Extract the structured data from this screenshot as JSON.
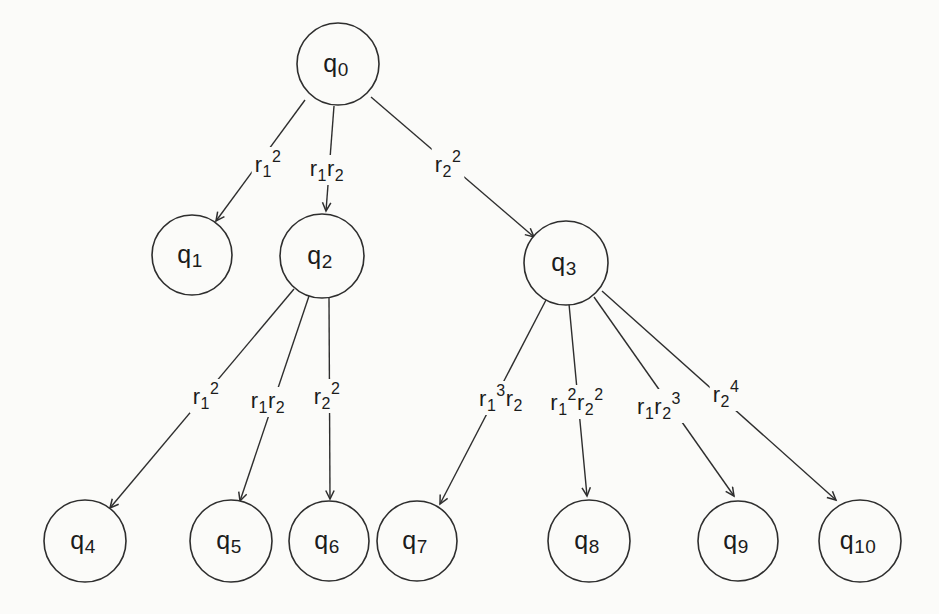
{
  "page": {
    "background": "#fbfbf9",
    "ink": "#2e2e2e",
    "text_color": "#1c1c1c"
  },
  "diagram": {
    "kind": "tree",
    "width": 939,
    "height": 614,
    "nodes": [
      {
        "id": "q0",
        "label": "q_0",
        "x": 338,
        "y": 64,
        "r": 41
      },
      {
        "id": "q1",
        "label": "q_1",
        "x": 192,
        "y": 255,
        "r": 40
      },
      {
        "id": "q2",
        "label": "q_2",
        "x": 322,
        "y": 256,
        "r": 42
      },
      {
        "id": "q3",
        "label": "q_3",
        "x": 566,
        "y": 263,
        "r": 42
      },
      {
        "id": "q4",
        "label": "q_4",
        "x": 85,
        "y": 541,
        "r": 41
      },
      {
        "id": "q5",
        "label": "q_5",
        "x": 231,
        "y": 541,
        "r": 41
      },
      {
        "id": "q6",
        "label": "q_6",
        "x": 329,
        "y": 541,
        "r": 40
      },
      {
        "id": "q7",
        "label": "q_7",
        "x": 417,
        "y": 541,
        "r": 40
      },
      {
        "id": "q8",
        "label": "q_8",
        "x": 589,
        "y": 541,
        "r": 41
      },
      {
        "id": "q9",
        "label": "q_9",
        "x": 738,
        "y": 541,
        "r": 40
      },
      {
        "id": "q10",
        "label": "q_10",
        "x": 860,
        "y": 541,
        "r": 41
      }
    ],
    "edges": [
      {
        "from": "q0",
        "to": "q1",
        "label": "r_1^2",
        "x1": 305,
        "y1": 100,
        "x2": 216,
        "y2": 221,
        "lx": 268,
        "ly": 172
      },
      {
        "from": "q0",
        "to": "q2",
        "label": "r_1r_2",
        "x1": 334,
        "y1": 106,
        "x2": 326,
        "y2": 211,
        "lx": 327,
        "ly": 176
      },
      {
        "from": "q0",
        "to": "q3",
        "label": "r_2^2",
        "x1": 371,
        "y1": 97,
        "x2": 534,
        "y2": 237,
        "lx": 448,
        "ly": 172
      },
      {
        "from": "q2",
        "to": "q4",
        "label": "r_1^2",
        "x1": 294,
        "y1": 289,
        "x2": 110,
        "y2": 508,
        "lx": 206,
        "ly": 404
      },
      {
        "from": "q2",
        "to": "q5",
        "label": "r_1r_2",
        "x1": 309,
        "y1": 296,
        "x2": 240,
        "y2": 501,
        "lx": 268,
        "ly": 408
      },
      {
        "from": "q2",
        "to": "q6",
        "label": "r_2^2",
        "x1": 329,
        "y1": 298,
        "x2": 330,
        "y2": 499,
        "lx": 327,
        "ly": 404
      },
      {
        "from": "q3",
        "to": "q7",
        "label": "r_1^3r_2",
        "x1": 546,
        "y1": 300,
        "x2": 440,
        "y2": 504,
        "lx": 501,
        "ly": 406
      },
      {
        "from": "q3",
        "to": "q8",
        "label": "r_1^2r_2^2",
        "x1": 569,
        "y1": 304,
        "x2": 587,
        "y2": 496,
        "lx": 577,
        "ly": 410
      },
      {
        "from": "q3",
        "to": "q9",
        "label": "r_1r_2^3",
        "x1": 594,
        "y1": 297,
        "x2": 734,
        "y2": 496,
        "lx": 659,
        "ly": 414
      },
      {
        "from": "q3",
        "to": "q10",
        "label": "r_2^4",
        "x1": 602,
        "y1": 291,
        "x2": 836,
        "y2": 500,
        "lx": 726,
        "ly": 402
      }
    ]
  }
}
